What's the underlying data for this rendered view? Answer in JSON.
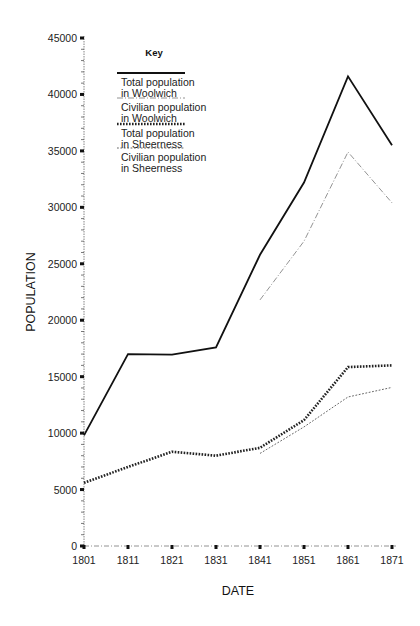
{
  "chart_data": {
    "type": "line",
    "title": "",
    "xlabel": "DATE",
    "ylabel": "POPULATION",
    "x": [
      1801,
      1811,
      1821,
      1831,
      1841,
      1851,
      1861,
      1871
    ],
    "x_tick_labels": [
      "1801",
      "1811",
      "1821",
      "1831",
      "1841",
      "1851",
      "1861",
      "1871"
    ],
    "y_tick_labels": [
      "0",
      "5000",
      "10000",
      "15000",
      "20000",
      "25000",
      "30000",
      "35000",
      "40000",
      "45000"
    ],
    "y_ticks": [
      0,
      5000,
      10000,
      15000,
      20000,
      25000,
      30000,
      35000,
      40000,
      45000
    ],
    "y_minor_step": 1000,
    "ylim": [
      0,
      45000
    ],
    "grid": false,
    "legend": {
      "title": "Key",
      "placement": "top-left"
    },
    "series": [
      {
        "name": "Total population in Woolwich",
        "label_lines": [
          "Total population",
          "in Woolwich"
        ],
        "style": "solid",
        "color": "#111111",
        "values": [
          9800,
          17000,
          16950,
          17600,
          25800,
          32200,
          41600,
          35500
        ]
      },
      {
        "name": "Civilian population in Woolwich",
        "label_lines": [
          "Civilian population",
          "in Woolwich"
        ],
        "style": "dash-dot",
        "color": "#777777",
        "values": [
          null,
          null,
          null,
          null,
          21800,
          27000,
          34900,
          30400
        ]
      },
      {
        "name": "Total population in Sheerness",
        "label_lines": [
          "Total population",
          "in Sheerness"
        ],
        "style": "heavy-dotted",
        "color": "#222222",
        "values": [
          5600,
          7000,
          8350,
          8000,
          8700,
          11150,
          15850,
          16000
        ]
      },
      {
        "name": "Civilian population in Sheerness",
        "label_lines": [
          "Civilian population",
          "in Sheerness"
        ],
        "style": "light-dotted",
        "color": "#555555",
        "values": [
          null,
          null,
          null,
          null,
          8200,
          10550,
          13200,
          14050
        ]
      }
    ]
  }
}
